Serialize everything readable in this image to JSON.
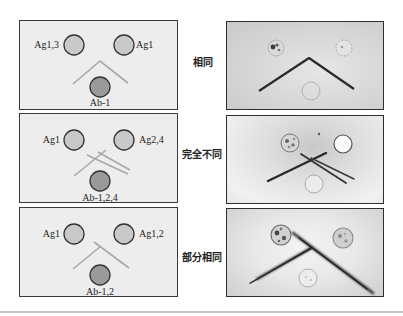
{
  "figure": {
    "type": "double immunodiffusion (Ouchterlony) comparison",
    "rows": [
      {
        "result_label": "相同",
        "diagram": {
          "antigen_left": "Ag1,3",
          "antigen_right": "Ag1",
          "antibody": "Ab-1"
        },
        "precipitin_pattern": "fused arc (identity)"
      },
      {
        "result_label": "完全不同",
        "diagram": {
          "antigen_left": "Ag1",
          "antigen_right": "Ag2,4",
          "antibody": "Ab-1,2,4"
        },
        "precipitin_pattern": "crossing lines (non-identity)"
      },
      {
        "result_label": "部分相同",
        "diagram": {
          "antigen_left": "Ag1",
          "antigen_right": "Ag1,2",
          "antibody": "Ab-1,2"
        },
        "precipitin_pattern": "arc with spur (partial identity)"
      }
    ]
  },
  "colors": {
    "schematic_background": "#ededed",
    "antigen_well": "#c9c9c9",
    "antibody_well": "#9a9a9a",
    "well_outline": "#333333",
    "schematic_precipitin_line": "#a8a8a8",
    "photo_precipitin_line": "#2a2a2a",
    "divider": "#c4c4c4"
  }
}
